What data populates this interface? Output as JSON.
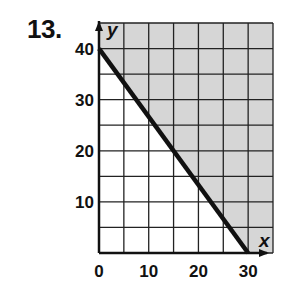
{
  "problem_number": "13.",
  "colors": {
    "shade": "#d6d6d6",
    "grid": "#222222",
    "line": "#111111",
    "background": "#ffffff"
  },
  "chart_data": {
    "type": "line",
    "title": "",
    "xlabel": "x",
    "ylabel": "y",
    "xlim": [
      0,
      35
    ],
    "ylim": [
      0,
      45
    ],
    "grid": true,
    "grid_step": 5,
    "x_ticks": [
      0,
      10,
      20,
      30
    ],
    "y_ticks": [
      10,
      20,
      30,
      40
    ],
    "x_tick_labels": [
      "0",
      "10",
      "20",
      "30"
    ],
    "y_tick_labels": [
      "10",
      "20",
      "30",
      "40"
    ],
    "series": [
      {
        "name": "boundary line",
        "x": [
          0,
          30
        ],
        "y": [
          40,
          0
        ],
        "style": "solid"
      }
    ],
    "shaded_region": "above the line (x/30 + y/40 >= 1)",
    "legend": null
  }
}
